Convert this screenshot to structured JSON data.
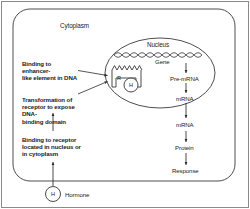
{
  "figure": {
    "type": "biology-diagram"
  },
  "compartments": {
    "cytoplasm_label": "Cytoplasm",
    "nucleus_label": "Nucleus"
  },
  "annotations": {
    "enhancer": "Binding to enhancer-\nlike element in DNA",
    "transformation": "Transformation of\nreceptor to expose DNA-\nbinding domain",
    "receptor_binding": "Binding to receptor\nlocated in nucleus or\nin cytoplasm"
  },
  "glyphs": {
    "receptor": "R",
    "hormone_in_receptor": "H",
    "hormone_free": "H",
    "hormone_label": "Hormone"
  },
  "flow": {
    "gene": "Gene",
    "pre_mrna": "Pre-mRNA",
    "mrna_nuclear": "mRNA",
    "mrna_cytoplasmic": "mRNA",
    "protein": "Protein",
    "response": "Response"
  },
  "colors": {
    "ink": "#1a1a1a",
    "stroke": "#333333",
    "frame": "#8a8a8a",
    "background": "#ffffff"
  }
}
